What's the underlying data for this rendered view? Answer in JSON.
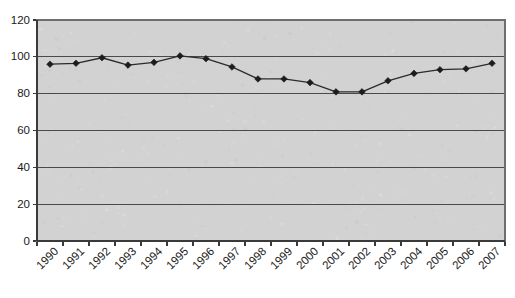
{
  "chart_data": {
    "type": "line",
    "title": "",
    "subtitle": "",
    "xlabel": "",
    "ylabel": "",
    "categories": [
      "1990",
      "1991",
      "1992",
      "1993",
      "1994",
      "1995",
      "1996",
      "1997",
      "1998",
      "1999",
      "2000",
      "2001",
      "2002",
      "2003",
      "2004",
      "2005",
      "2006",
      "2007"
    ],
    "values": [
      96,
      96.5,
      99.5,
      95.5,
      97,
      100.5,
      99,
      94.5,
      88,
      88,
      86,
      81,
      81,
      87,
      91,
      93,
      93.5,
      96.5
    ],
    "series": [
      {
        "name": "series-1",
        "values": [
          96,
          96.5,
          99.5,
          95.5,
          97,
          100.5,
          99,
          94.5,
          88,
          88,
          86,
          81,
          81,
          87,
          91,
          93,
          93.5,
          96.5
        ]
      }
    ],
    "ylim": [
      0,
      120
    ],
    "yticks": [
      0,
      20,
      40,
      60,
      80,
      100,
      120
    ],
    "ytick_labels": [
      "0",
      "20",
      "40",
      "60",
      "80",
      "100",
      "120"
    ],
    "xtick_labels": [
      "1990",
      "1991",
      "1992",
      "1993",
      "1994",
      "1995",
      "1996",
      "1997",
      "1998",
      "1999",
      "2000",
      "2001",
      "2002",
      "2003",
      "2004",
      "2005",
      "2006",
      "2007"
    ],
    "grid": true,
    "grid_axis": "y",
    "legend": false,
    "legend_position": "none",
    "marker": "diamond",
    "annotations": []
  },
  "style": {
    "plot_background": "#d2d2d2",
    "page_background": "#ffffff",
    "line_color": "#2b2b2b",
    "marker_color": "#1c1c1c",
    "gridline_color": "#4a4a4a",
    "axis_color": "#3a3a3a",
    "border_color": "#6e6e6e",
    "tick_label_color": "#1a1a1a"
  },
  "layout": {
    "plot_left": 37,
    "plot_right": 505,
    "plot_top": 20,
    "plot_bottom": 241,
    "xtick_label_rotation": -45
  }
}
